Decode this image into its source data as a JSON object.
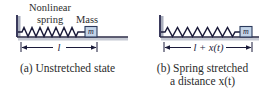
{
  "figure": {
    "background_color": "#ffffff",
    "width": 270,
    "height": 103
  },
  "colors": {
    "line": "#1b1b3a",
    "wall": "#3a3a5c",
    "wall_shadow": "#a9aebd",
    "floor": "#2b2b46",
    "floor_shadow": "#c6cad4",
    "mass_fill": "#c3d4e8",
    "mass_stroke": "#2b3a5c",
    "text": "#2b2b2b",
    "dimension": "#1b1b3a"
  },
  "panels": [
    {
      "id": "a",
      "labels": {
        "spring_line1": "Nonlinear",
        "spring_line2": "spring",
        "mass": "Mass"
      },
      "mass_symbol": "m",
      "dimension_label": "l",
      "dimension_label_plain": "l",
      "spring_coils": 9,
      "caption_line1": "(a) Unstretched state",
      "caption_line2": ""
    },
    {
      "id": "b",
      "labels": {
        "spring_line1": "",
        "spring_line2": "",
        "mass": ""
      },
      "mass_symbol": "m",
      "dimension_label": "l + x(t)",
      "dimension_label_plain": "l + x(t)",
      "spring_coils": 9,
      "caption_line1": "(b) Spring stretched",
      "caption_line2": "a distance x(t)"
    }
  ]
}
